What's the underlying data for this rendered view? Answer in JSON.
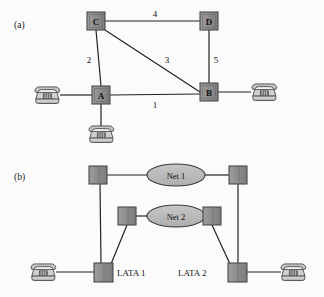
{
  "figure": {
    "title": "",
    "background": "#fbfbfb",
    "width": 324,
    "height": 297
  },
  "colors": {
    "node_fill": "#8c8c8c",
    "node_fill_light": "#a3a3a3",
    "node_stroke": "#4a4a4a",
    "edge": "#222222",
    "ellipse_fill": "#b9b9b9",
    "ellipse_stroke": "#3a3a3a",
    "phone_body": "#d6d6d6",
    "phone_shade": "#9a9a9a",
    "phone_stroke": "#3d3d3d",
    "text": "#111111"
  },
  "panels": [
    {
      "id": "a",
      "label": "(a)",
      "label_pos": {
        "x": 14,
        "y": 28
      },
      "nodes": [
        {
          "name": "C",
          "label": "C",
          "x": 96,
          "y": 21,
          "w": 18,
          "h": 18
        },
        {
          "name": "D",
          "label": "D",
          "x": 209,
          "y": 21,
          "w": 18,
          "h": 18
        },
        {
          "name": "A",
          "label": "A",
          "x": 101,
          "y": 95,
          "w": 18,
          "h": 18
        },
        {
          "name": "B",
          "label": "B",
          "x": 209,
          "y": 92,
          "w": 18,
          "h": 18
        }
      ],
      "edges": [
        {
          "from": "C",
          "to": "D",
          "label": "4",
          "label_x": 155,
          "label_y": 17
        },
        {
          "from": "C",
          "to": "A",
          "label": "2",
          "label_x": 89,
          "label_y": 63
        },
        {
          "from": "C",
          "to": "B",
          "label": "3",
          "label_x": 167,
          "label_y": 63
        },
        {
          "from": "D",
          "to": "B",
          "label": "5",
          "label_x": 216,
          "label_y": 63
        },
        {
          "from": "A",
          "to": "B",
          "label": "1",
          "label_x": 155,
          "label_y": 108
        }
      ],
      "phones": [
        {
          "name": "phone-left-a",
          "x": 47,
          "y": 95,
          "attach": "A",
          "side": "left"
        },
        {
          "name": "phone-right-b",
          "x": 264,
          "y": 92,
          "attach": "B",
          "side": "right"
        },
        {
          "name": "phone-below-a",
          "x": 101,
          "y": 132,
          "attach": "A",
          "side": "bottom"
        }
      ]
    },
    {
      "id": "b",
      "label": "(b)",
      "label_pos": {
        "x": 14,
        "y": 180
      },
      "nodes": [
        {
          "name": "switch-top-left",
          "label": "",
          "x": 98,
          "y": 175,
          "w": 18,
          "h": 18
        },
        {
          "name": "switch-top-right",
          "label": "",
          "x": 238,
          "y": 175,
          "w": 18,
          "h": 18
        },
        {
          "name": "switch-mid-left",
          "label": "",
          "x": 127,
          "y": 216,
          "w": 18,
          "h": 18
        },
        {
          "name": "switch-mid-right",
          "label": "",
          "x": 212,
          "y": 216,
          "w": 18,
          "h": 18
        },
        {
          "name": "switch-lata-1",
          "label": "",
          "x": 103,
          "y": 272,
          "w": 19,
          "h": 19
        },
        {
          "name": "switch-lata-2",
          "label": "",
          "x": 237,
          "y": 272,
          "w": 19,
          "h": 19
        }
      ],
      "clouds": [
        {
          "name": "net-1",
          "label": "Net 1",
          "cx": 176,
          "cy": 175,
          "rx": 29,
          "ry": 11
        },
        {
          "name": "net-2",
          "label": "Net 2",
          "cx": 176,
          "cy": 216,
          "rx": 29,
          "ry": 11
        }
      ],
      "lata_labels": [
        {
          "name": "lata-1-label",
          "label": "LATA 1",
          "x": 117,
          "y": 276
        },
        {
          "name": "lata-2-label",
          "label": "LATA 2",
          "x": 178,
          "y": 276
        }
      ],
      "phones": [
        {
          "name": "phone-left-b",
          "x": 43,
          "y": 272,
          "attach": "switch-lata-1",
          "side": "left"
        },
        {
          "name": "phone-right-b",
          "x": 293,
          "y": 272,
          "attach": "switch-lata-2",
          "side": "right"
        }
      ]
    }
  ]
}
